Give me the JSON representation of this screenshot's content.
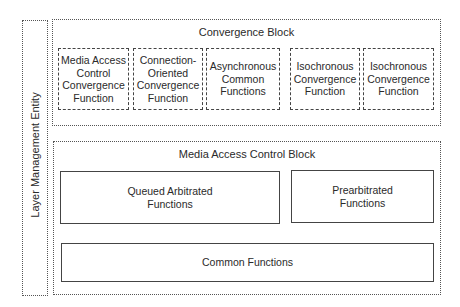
{
  "layer_management_entity": {
    "label": "Layer Management Entity"
  },
  "convergence_block": {
    "title": "Convergence Block",
    "functions": [
      {
        "label": "Media Access\nControl\nConvergence\nFunction"
      },
      {
        "label": "Connection-\nOriented\nConvergence\nFunction"
      },
      {
        "label": "Asynchronous\nCommon\nFunctions"
      },
      {
        "label": "Isochronous\nConvergence\nFunction"
      },
      {
        "label": "Isochronous\nConvergence\nFunction"
      }
    ]
  },
  "mac_block": {
    "title": "Media Access Control Block",
    "queued": {
      "label": "Queued Arbitrated\nFunctions"
    },
    "prearbitrated": {
      "label": "Prearbitrated\nFunctions"
    },
    "common": {
      "label": "Common Functions"
    }
  }
}
